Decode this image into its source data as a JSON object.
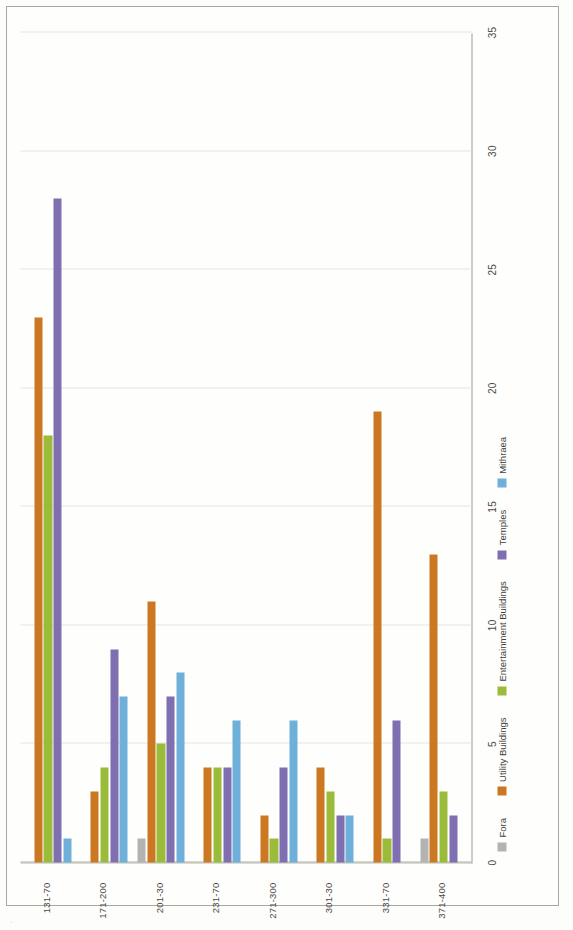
{
  "figure": {
    "orientation": "rotated-landscape-scan",
    "background_color": "#fdfdfb",
    "frame_color": "#a8a8a0"
  },
  "chart_data": {
    "type": "bar",
    "orientation": "horizontal",
    "title": "",
    "xlabel": "",
    "ylabel": "",
    "categories": [
      "131-70",
      "171-200",
      "201-30",
      "231-70",
      "271-300",
      "301-30",
      "331-70",
      "371-400"
    ],
    "axis_ticks": [
      "0",
      "5",
      "10",
      "15",
      "20",
      "25",
      "30",
      "35"
    ],
    "axis_min": 0,
    "axis_max": 35,
    "grid": true,
    "legend_position": "bottom",
    "series": [
      {
        "name": "Fora",
        "color": "#b3b3b3",
        "values": [
          0,
          0,
          1,
          0,
          0,
          0,
          0,
          1
        ]
      },
      {
        "name": "Utility Buildings",
        "color": "#cc7722",
        "values": [
          23,
          3,
          11,
          4,
          2,
          4,
          19,
          13
        ]
      },
      {
        "name": "Entertainment Buildings",
        "color": "#9bbb3a",
        "values": [
          18,
          4,
          5,
          4,
          1,
          3,
          1,
          3
        ]
      },
      {
        "name": "Temples",
        "color": "#7f6fb0",
        "values": [
          28,
          9,
          7,
          4,
          4,
          2,
          6,
          2
        ]
      },
      {
        "name": "Mithraea",
        "color": "#6fb0da",
        "values": [
          1,
          7,
          8,
          6,
          6,
          2,
          0,
          0
        ]
      }
    ]
  },
  "legend": {
    "items": [
      {
        "label": "Fora",
        "color": "#b3b3b3"
      },
      {
        "label": "Utility Buildings",
        "color": "#cc7722"
      },
      {
        "label": "Entertainment Buildings",
        "color": "#9bbb3a"
      },
      {
        "label": "Temples",
        "color": "#7f6fb0"
      },
      {
        "label": "Mithraea",
        "color": "#6fb0da"
      }
    ]
  }
}
